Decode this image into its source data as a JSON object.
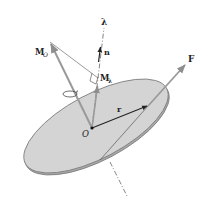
{
  "labels": {
    "lambda": "λ",
    "n": "n",
    "M_O_main": "M",
    "M_O_sub": "O",
    "M_lambda_main": "M",
    "M_lambda_sub": "λ",
    "F": "F",
    "r": "r",
    "O": "O"
  },
  "colors": {
    "disc_fill": "#d4d4d4",
    "disc_edge": "#7a7a7a",
    "disc_rim": "#a8a8a8",
    "vector_gray": "#9a9a9a",
    "vector_dark": "#222222",
    "line": "#555555"
  }
}
